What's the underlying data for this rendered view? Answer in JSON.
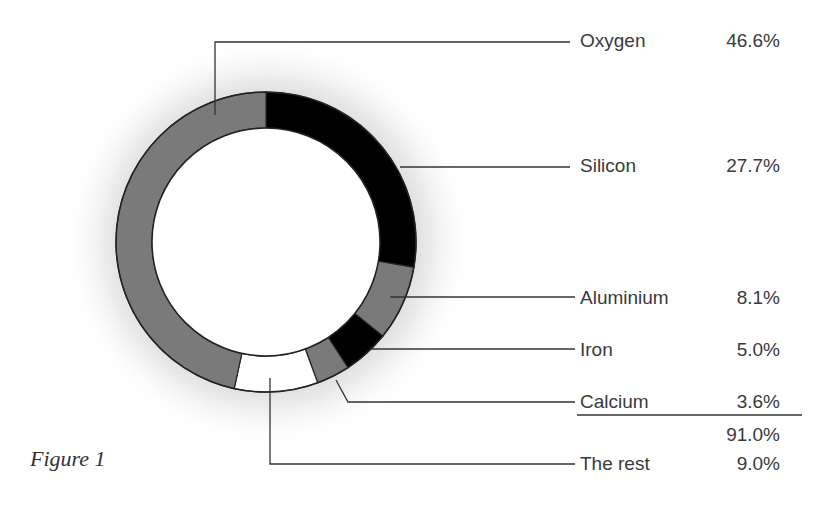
{
  "caption": "Figure 1",
  "chart_data": {
    "type": "pie",
    "variant": "donut",
    "title": "",
    "caption": "Figure 1",
    "start_angle_deg": 0,
    "direction": "clockwise",
    "categories": [
      "Silicon",
      "Aluminium",
      "Iron",
      "Calcium",
      "The rest",
      "Oxygen"
    ],
    "values": [
      27.7,
      8.1,
      5.0,
      3.6,
      9.0,
      46.6
    ],
    "colors": [
      "#000000",
      "#7a7a7a",
      "#000000",
      "#7a7a7a",
      "#ffffff",
      "#7a7a7a"
    ],
    "legend_order": [
      "Oxygen",
      "Silicon",
      "Aluminium",
      "Iron",
      "Calcium",
      "The rest"
    ],
    "subtotal_label": "91.0%",
    "subtotal_value": 91.0,
    "unit": "%"
  },
  "legend": [
    {
      "name": "Oxygen",
      "value": "46.6%"
    },
    {
      "name": "Silicon",
      "value": "27.7%"
    },
    {
      "name": "Aluminium",
      "value": "8.1%"
    },
    {
      "name": "Iron",
      "value": "5.0%"
    },
    {
      "name": "Calcium",
      "value": "3.6%"
    },
    {
      "name": "The rest",
      "value": "9.0%"
    }
  ],
  "subtotal": "91.0%"
}
